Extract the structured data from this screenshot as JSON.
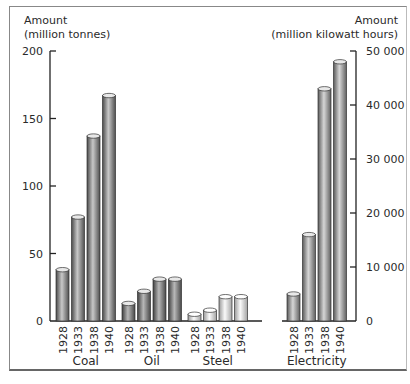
{
  "chart_data": {
    "type": "bar",
    "title": "",
    "left_axis": {
      "label_line1": "Amount",
      "label_line2": "(million tonnes)",
      "ticks": [
        0,
        50,
        100,
        150,
        200
      ],
      "tick_labels": [
        "0",
        "50",
        "100",
        "150",
        "200"
      ],
      "ylim": [
        0,
        200
      ]
    },
    "right_axis": {
      "label_line1": "Amount",
      "label_line2": "(million kilowatt hours)",
      "ticks": [
        0,
        10000,
        20000,
        30000,
        40000,
        50000
      ],
      "tick_labels": [
        "0",
        "10 000",
        "20 000",
        "30 000",
        "40 000",
        "50 000"
      ],
      "ylim": [
        0,
        50000
      ]
    },
    "groups": [
      {
        "name": "Coal",
        "axis": "left",
        "color": "#8a8a8a",
        "categories": [
          "1928",
          "1933",
          "1938",
          "1940"
        ],
        "values": [
          38,
          77,
          137,
          167
        ]
      },
      {
        "name": "Oil",
        "axis": "left",
        "color": "#7a7a7a",
        "categories": [
          "1928",
          "1933",
          "1938",
          "1940"
        ],
        "values": [
          13,
          22,
          31,
          31
        ]
      },
      {
        "name": "Steel",
        "axis": "left",
        "color": "#e6e6e6",
        "categories": [
          "1928",
          "1933",
          "1938",
          "1940"
        ],
        "values": [
          5,
          8,
          18,
          18
        ]
      },
      {
        "name": "Electricity",
        "axis": "right",
        "color": "#a8a8a8",
        "categories": [
          "1928",
          "1933",
          "1938",
          "1940"
        ],
        "values": [
          5000,
          16000,
          43000,
          48000
        ]
      }
    ],
    "grid": false,
    "legend": "none"
  }
}
